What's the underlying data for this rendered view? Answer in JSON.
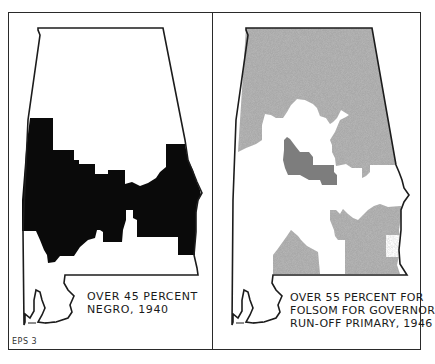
{
  "figure": {
    "id_label": "EPS 3",
    "colors": {
      "outline": "#1c1c1c",
      "negro_fill": "#0a0a0a",
      "folsom_fill": "#a9a9a9",
      "folsom_fill_dark": "#7d7d7d",
      "background": "#ffffff"
    }
  },
  "maps": [
    {
      "name": "negro-population-1940",
      "caption_lines": [
        "OVER 45 PERCENT",
        "NEGRO, 1940"
      ],
      "legend": "Shaded (black) area = counties over 45 percent Negro population, 1940"
    },
    {
      "name": "folsom-runoff-1946",
      "caption_lines": [
        "OVER 55 PERCENT FOR",
        "FOLSOM FOR GOVERNOR",
        "RUN-OFF PRIMARY, 1946"
      ],
      "legend": "Shaded (gray stipple) area = counties over 55 percent for Folsom, 1946 governor run-off primary"
    }
  ]
}
